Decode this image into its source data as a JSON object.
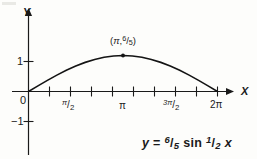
{
  "figure": {
    "axes": {
      "x_label": "X",
      "y_label": "Y",
      "origin_label": "0"
    },
    "x_ticks": [
      {
        "value": "pi/2",
        "numerator": "π",
        "denominator": "2",
        "slash": "/"
      },
      {
        "value": "pi",
        "text": "π"
      },
      {
        "value": "3pi/2",
        "numerator": "3π",
        "denominator": "2",
        "slash": "/"
      },
      {
        "value": "2pi",
        "text": "2π"
      }
    ],
    "y_ticks": [
      "1",
      "−1"
    ],
    "point_label": {
      "open": "(",
      "x": "π",
      "comma": ",",
      "numerator": "6",
      "slash": "/",
      "denominator": "5",
      "close": ")"
    },
    "equation": {
      "lhs": "y",
      "equals": "=",
      "amp_numerator": "6",
      "amp_slash": "/",
      "amp_denominator": "5",
      "fn": "sin",
      "arg_numerator": "1",
      "arg_slash": "/",
      "arg_denominator": "2",
      "variable": "x"
    },
    "colors": {
      "ink": "#1a1a1a",
      "paper": "#fdfdfb",
      "curve": "#141414"
    }
  },
  "chart_data": {
    "type": "line",
    "title": "",
    "subtitle": "",
    "xlabel": "X",
    "ylabel": "Y",
    "equation": "y = 6/5 sin 1/2 x",
    "amplitude": 1.2,
    "period": 12.566370614359172,
    "xlim": [
      -0.6981317007977318,
      7.330382858376184
    ],
    "ylim": [
      -1.6,
      1.75
    ],
    "grid": false,
    "legend": null,
    "x_tick_values": [
      0,
      0.7853981633974483,
      1.5707963267948966,
      2.356194490192345,
      3.141592653589793,
      3.9269908169872414,
      4.71238898038469,
      5.497787143782138,
      6.283185307179586
    ],
    "x_tick_labels": [
      "0",
      "",
      "π/2",
      "",
      "π",
      "",
      "3π/2",
      "",
      "2π"
    ],
    "y_tick_values": [
      -1,
      1
    ],
    "y_tick_labels": [
      "−1",
      "1"
    ],
    "annotations": [
      {
        "text": "(π, 6/5)",
        "x": 3.141592653589793,
        "y": 1.2,
        "marker": "dot"
      }
    ],
    "series": [
      {
        "name": "y = 6/5 sin 1/2 x",
        "x": [
          0,
          0.3141592653589793,
          0.6283185307179586,
          0.9424777960769379,
          1.2566370614359172,
          1.5707963267948966,
          1.8849555921538759,
          2.199114857512855,
          2.5132741228718345,
          2.827433388230814,
          3.141592653589793,
          3.4557519189487724,
          3.7699111843077517,
          4.084070449666731,
          4.39822971502571,
          4.71238898038469,
          5.026548245743669,
          5.340707511102648,
          5.654866776461628,
          5.969026041820607,
          6.283185307179586
        ],
        "y": [
          0,
          0.1876,
          0.3708,
          0.5452,
          0.7053,
          0.8485,
          0.9708,
          1.0693,
          1.1413,
          1.1854,
          1.2,
          1.1854,
          1.1413,
          1.0693,
          0.9708,
          0.8485,
          0.7053,
          0.5452,
          0.3708,
          0.1876,
          0
        ]
      }
    ]
  }
}
